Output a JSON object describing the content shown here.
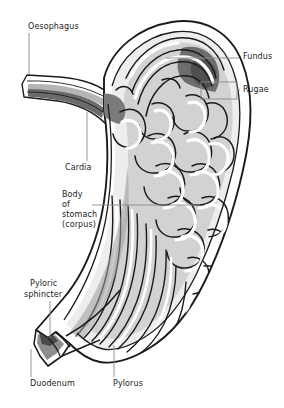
{
  "figure": {
    "type": "anatomical-diagram",
    "background_color": "#ffffff",
    "ink_color": "#1b1b1b",
    "leader_color": "#7a7a7a",
    "shading": {
      "outer_wall": "#ffffff",
      "muscle_light": "#d9d9d9",
      "mucosa_mid": "#b5b5b5",
      "mucosa_dark": "#8f8f8f",
      "lumen_darkest": "#6b6b6b"
    }
  },
  "labels": {
    "oesophagus": "Oesophagus",
    "cardia": "Cardia",
    "fundus": "Fundus",
    "rugae": "Rugae",
    "body_line1": "Body",
    "body_line2": "of",
    "body_line3": "stomach",
    "body_line4": "(corpus)",
    "pyloric_line1": "Pyloric",
    "pyloric_line2": "sphincter",
    "duodenum": "Duodenum",
    "pylorus": "Pylorus"
  }
}
